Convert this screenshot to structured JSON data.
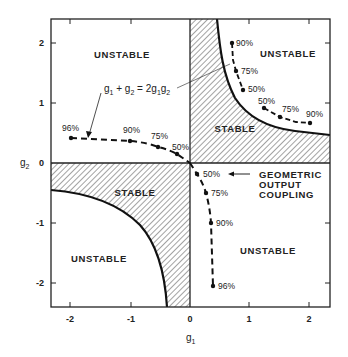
{
  "diagram": {
    "type": "stability-diagram",
    "x_axis": {
      "label": "g1",
      "ticks": [
        "-2",
        "-1",
        "0",
        "1",
        "2"
      ]
    },
    "y_axis": {
      "label": "g2",
      "ticks": [
        "2",
        "1",
        "0",
        "-1",
        "-2"
      ]
    },
    "regions": {
      "unstable_top_left": "UNSTABLE",
      "unstable_top_right": "UNSTABLE",
      "unstable_bottom_left": "UNSTABLE",
      "unstable_bottom_right": "UNSTABLE",
      "stable_upper": "STABLE",
      "stable_lower": "STABLE"
    },
    "equation_label": {
      "g1": "g",
      "sub1": "1",
      "plus": " + g",
      "sub2": "2",
      "eq": " = 2g",
      "sub3": "1",
      "g3": "g",
      "sub4": "2"
    },
    "annotation": {
      "line1": "GEOMETRIC",
      "line2": "OUTPUT",
      "line3": "COUPLING"
    },
    "points": {
      "left": [
        {
          "label": "96%",
          "g1": -2.0,
          "g2": 0.42
        },
        {
          "label": "90%",
          "g1": -1.0,
          "g2": 0.37
        },
        {
          "label": "75%",
          "g1": -0.53,
          "g2": 0.27
        },
        {
          "label": "50%",
          "g1": -0.22,
          "g2": 0.15
        }
      ],
      "bottom": [
        {
          "label": "50%",
          "g1": 0.12,
          "g2": -0.18
        },
        {
          "label": "75%",
          "g1": 0.27,
          "g2": -0.5
        },
        {
          "label": "90%",
          "g1": 0.35,
          "g2": -1.0
        },
        {
          "label": "96%",
          "g1": 0.39,
          "g2": -2.05
        }
      ],
      "upper_vertical": [
        {
          "label": "90%",
          "g1": 0.7,
          "g2": 2.0
        },
        {
          "label": "75%",
          "g1": 0.77,
          "g2": 1.53
        },
        {
          "label": "50%",
          "g1": 0.89,
          "g2": 1.22
        }
      ],
      "upper_horizontal": [
        {
          "label": "50%",
          "g1": 1.24,
          "g2": 0.92
        },
        {
          "label": "75%",
          "g1": 1.5,
          "g2": 0.77
        },
        {
          "label": "90%",
          "g1": 2.0,
          "g2": 0.67
        }
      ]
    },
    "boundary": "g1*g2 = 1",
    "colors": {
      "ink": "#222222",
      "background": "#ffffff"
    }
  }
}
